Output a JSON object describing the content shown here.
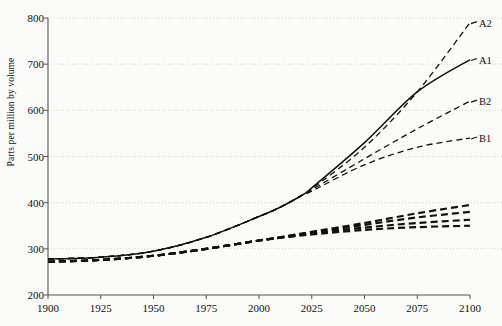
{
  "chart_data": {
    "type": "line",
    "title": "",
    "xlabel": "",
    "ylabel": "Parts per million by volume",
    "xlim": [
      1900,
      2100
    ],
    "ylim": [
      200,
      800
    ],
    "xticks": [
      1900,
      1925,
      1950,
      1975,
      2000,
      2025,
      2050,
      2075,
      2100
    ],
    "yticks": [
      200,
      300,
      400,
      500,
      600,
      700,
      800
    ],
    "grid": "horizontal-dotted",
    "legend_position": "right-inline-labels",
    "x": [
      1900,
      1925,
      1950,
      1975,
      2000,
      2010,
      2020,
      2025,
      2050,
      2075,
      2100
    ],
    "series": [
      {
        "name": "A2",
        "label": "A2",
        "style": "dashed",
        "label_value": 790,
        "values": [
          278,
          282,
          295,
          325,
          370,
          390,
          415,
          430,
          520,
          640,
          790
        ]
      },
      {
        "name": "A1",
        "label": "A1",
        "style": "solid",
        "label_value": 710,
        "values": [
          278,
          282,
          295,
          325,
          370,
          390,
          415,
          432,
          530,
          640,
          710
        ]
      },
      {
        "name": "B2",
        "label": "B2",
        "style": "dashed",
        "label_value": 620,
        "values": [
          278,
          282,
          295,
          325,
          370,
          390,
          415,
          428,
          495,
          560,
          620
        ]
      },
      {
        "name": "B1",
        "label": "B1",
        "style": "dashed",
        "label_value": 540,
        "values": [
          278,
          282,
          295,
          325,
          370,
          390,
          415,
          425,
          482,
          520,
          540
        ]
      },
      {
        "name": "lower-a",
        "label": "",
        "style": "dashed-heavy",
        "label_value": 395,
        "values": [
          272,
          276,
          285,
          300,
          318,
          325,
          333,
          337,
          356,
          377,
          395
        ]
      },
      {
        "name": "lower-b",
        "label": "",
        "style": "dashed-heavy",
        "label_value": 380,
        "values": [
          272,
          276,
          285,
          300,
          318,
          325,
          332,
          335,
          352,
          368,
          380
        ]
      },
      {
        "name": "lower-c",
        "label": "",
        "style": "dashed-heavy",
        "label_value": 363,
        "values": [
          272,
          276,
          285,
          300,
          318,
          324,
          330,
          333,
          346,
          356,
          363
        ]
      },
      {
        "name": "lower-d",
        "label": "",
        "style": "dashed-heavy",
        "label_value": 350,
        "values": [
          272,
          276,
          285,
          300,
          318,
          324,
          329,
          331,
          341,
          347,
          350
        ]
      }
    ],
    "colors": {
      "line": "#111111",
      "axis": "#555555",
      "grid": "#c9c9c4",
      "background": "#fbfbf9"
    }
  }
}
